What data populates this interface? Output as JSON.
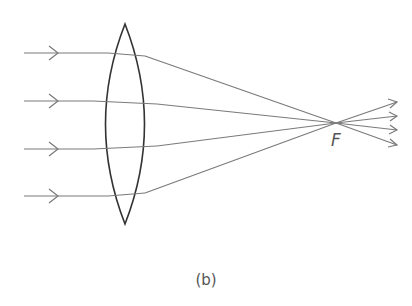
{
  "diagram": {
    "caption": "(b)",
    "focal_label": "F",
    "colors": {
      "lens": "#333333",
      "ray": "#7a7a7a",
      "text": "#555555",
      "background": "#ffffff"
    },
    "lens": {
      "type": "biconvex",
      "top": [
        125,
        24
      ],
      "bottom": [
        125,
        224
      ],
      "half_width": 32
    },
    "focal_point": [
      336,
      123
    ],
    "rays": [
      {
        "y": 53,
        "enter_x": 108,
        "exit_x": 145,
        "exit_y": 56
      },
      {
        "y": 101,
        "enter_x": 93,
        "exit_x": 157,
        "exit_y": 104
      },
      {
        "y": 149,
        "enter_x": 93,
        "exit_x": 157,
        "exit_y": 146
      },
      {
        "y": 196,
        "enter_x": 108,
        "exit_x": 145,
        "exit_y": 193
      }
    ]
  }
}
